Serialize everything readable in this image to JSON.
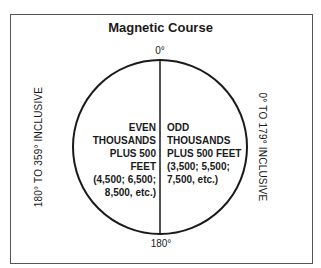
{
  "title": "Magnetic Course",
  "labels": {
    "top": "0°",
    "bottom": "180°",
    "left_side": "180° TO 359° INCLUSIVE",
    "right_side": "0° TO 179° INCLUSIVE"
  },
  "left_half": {
    "lines": [
      "EVEN",
      "THOUSANDS",
      "PLUS 500",
      "FEET",
      "(4,500; 6,500;",
      "8,500, etc.)"
    ]
  },
  "right_half": {
    "lines": [
      "ODD",
      "THOUSANDS",
      "PLUS 500 FEET",
      "(3,500; 5,500;",
      "7,500, etc.)"
    ]
  },
  "colors": {
    "stroke": "#1a1a1a",
    "frame": "#555555",
    "background": "#ffffff"
  }
}
